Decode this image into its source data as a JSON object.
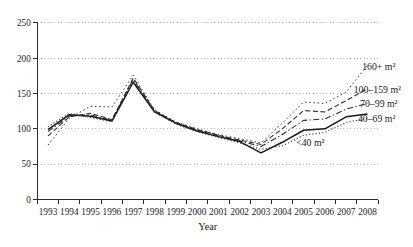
{
  "chart_data": {
    "type": "line",
    "title": "",
    "xlabel": "Year",
    "ylabel": "",
    "ylim": [
      0,
      250
    ],
    "yticks": [
      0,
      50,
      100,
      150,
      200,
      250
    ],
    "grid": "horizontal-dotted",
    "legend": "inline-labels-at-line-ends",
    "categories": [
      1993,
      1994,
      1995,
      1996,
      1997,
      1998,
      1999,
      2000,
      2001,
      2002,
      2003,
      2004,
      2005,
      2006,
      2007,
      2008
    ],
    "series": [
      {
        "name": "160+ m²",
        "style": "dotted-fine",
        "values": [
          77,
          115,
          132,
          131,
          176,
          127,
          110,
          100,
          92,
          86,
          80,
          108,
          138,
          136,
          152,
          190
        ]
      },
      {
        "name": "100–159 m²",
        "style": "dashed",
        "values": [
          90,
          117,
          122,
          113,
          172,
          126,
          109,
          99,
          91,
          84,
          78,
          100,
          126,
          124,
          140,
          157
        ]
      },
      {
        "name": "70–99 m²",
        "style": "dashdot",
        "values": [
          96,
          118,
          120,
          112,
          170,
          125,
          108,
          98,
          90,
          83,
          75,
          92,
          112,
          114,
          128,
          136
        ]
      },
      {
        "name": "40–69 m²",
        "style": "solid",
        "values": [
          99,
          120,
          118,
          111,
          166,
          124,
          108,
          97,
          89,
          82,
          66,
          81,
          98,
          100,
          117,
          121
        ]
      },
      {
        "name": "<40 m²",
        "style": "dotted",
        "values": [
          103,
          122,
          116,
          110,
          168,
          124,
          107,
          96,
          88,
          80,
          71,
          76,
          91,
          95,
          109,
          115
        ]
      }
    ],
    "annotations": [
      {
        "text": "160+ m²",
        "year": 2007.75,
        "value": 188
      },
      {
        "text": "100–159 m²",
        "year": 2007.35,
        "value": 156
      },
      {
        "text": "70–99 m²",
        "year": 2007.65,
        "value": 135
      },
      {
        "text": "40–69 m²",
        "year": 2007.55,
        "value": 115
      },
      {
        "text": "<40 m²",
        "year": 2004.65,
        "value": 80
      }
    ]
  },
  "colors": {
    "background": "#ffffff",
    "axis": "#2a2a2a",
    "grid": "#b5b5b5",
    "line_dark": "#1a1a1a",
    "line_mid": "#333333",
    "text": "#1a1a1a"
  }
}
